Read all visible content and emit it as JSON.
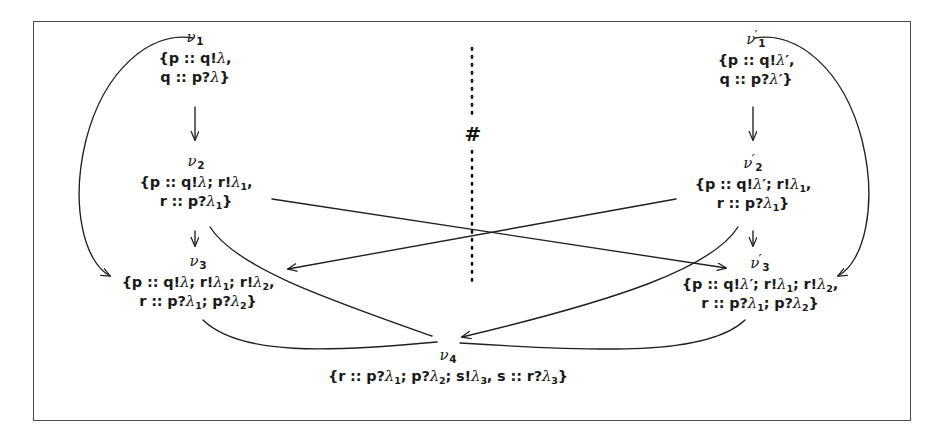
{
  "figure": {
    "separator_symbol": "#",
    "nodes": [
      {
        "id": "v1",
        "label_base": "ν",
        "label_sub": "1",
        "label_prime": "",
        "lines": [
          "{p :: q!λ,",
          "q :: p?λ}"
        ]
      },
      {
        "id": "v2",
        "label_base": "ν",
        "label_sub": "2",
        "label_prime": "",
        "lines": [
          "{p :: q!λ; r!λ₁,",
          "r :: p?λ₁}"
        ]
      },
      {
        "id": "v3",
        "label_base": "ν",
        "label_sub": "3",
        "label_prime": "",
        "lines": [
          "{p :: q!λ; r!λ₁; r!λ₂,",
          "r :: p?λ₁; p?λ₂}"
        ]
      },
      {
        "id": "v1p",
        "label_base": "ν",
        "label_sub": "1",
        "label_prime": "′",
        "lines": [
          "{p :: q!λ′,",
          "q :: p?λ′}"
        ]
      },
      {
        "id": "v2p",
        "label_base": "ν",
        "label_sub": "2",
        "label_prime": "′",
        "lines": [
          "{p :: q!λ′; r!λ₁,",
          "r :: p?λ₁}"
        ]
      },
      {
        "id": "v3p",
        "label_base": "ν",
        "label_sub": "3",
        "label_prime": "′",
        "lines": [
          "{p :: q!λ′; r!λ₁; r!λ₂,",
          "r :: p?λ₁; p?λ₂}"
        ]
      },
      {
        "id": "v4",
        "label_base": "ν",
        "label_sub": "4",
        "label_prime": "",
        "lines": [
          "{r :: p?λ₁; p?λ₂; s!λ₃, s :: r?λ₃}"
        ]
      }
    ],
    "colors": {
      "ink": "#1a1a1a",
      "frame": "#4a4a4a",
      "background": "#ffffff"
    }
  }
}
